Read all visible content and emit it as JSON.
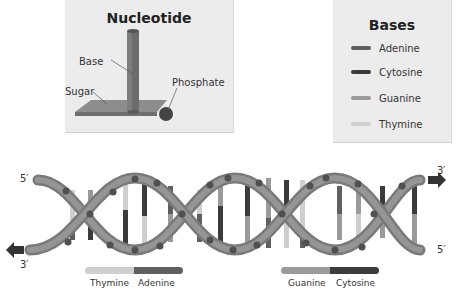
{
  "nucleotide": {
    "title": "Nucleotide",
    "labels": {
      "base": "Base",
      "sugar": "Sugar",
      "phosphate": "Phosphate"
    }
  },
  "bases_legend": {
    "title": "Bases",
    "items": [
      {
        "label": "Adenine",
        "color": "#5f5f5f"
      },
      {
        "label": "Cytosine",
        "color": "#3b3b3b"
      },
      {
        "label": "Guanine",
        "color": "#9a9a9a"
      },
      {
        "label": "Thymine",
        "color": "#cfcfcf"
      }
    ]
  },
  "helix": {
    "left_top_label": "5′",
    "left_bottom_label": "3′",
    "right_top_label": "3′",
    "right_bottom_label": "5′"
  },
  "pairs": [
    {
      "left": "Thymine",
      "right": "Adenine",
      "left_color": "#cfcfcf",
      "right_color": "#5f5f5f"
    },
    {
      "left": "Guanine",
      "right": "Cytosine",
      "left_color": "#9a9a9a",
      "right_color": "#3b3b3b"
    }
  ],
  "colors": {
    "backbone": "#8e8e8e",
    "backbone_dark": "#6e6e6e",
    "phosphate_dot": "#505050",
    "panel_bg": "#ececec"
  }
}
